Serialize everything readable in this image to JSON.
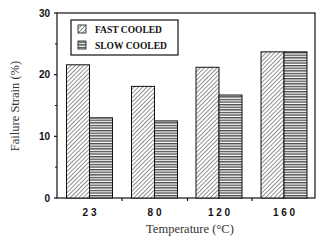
{
  "chart_data": {
    "type": "bar",
    "title": "",
    "xlabel": "Temperature (°C)",
    "ylabel": "Failure Strain (%)",
    "categories": [
      "2 3",
      "8 0",
      "1 2 0",
      "1 6 0"
    ],
    "series": [
      {
        "name": "FAST COOLED",
        "pattern": "diagonal-hatch",
        "values": [
          21.6,
          18.1,
          21.2,
          23.7
        ]
      },
      {
        "name": "SLOW COOLED",
        "pattern": "horizontal-lines",
        "values": [
          13.0,
          12.5,
          16.7,
          23.7
        ]
      }
    ],
    "ylim": [
      0,
      30
    ],
    "yticks": [
      "0",
      "10",
      "20",
      "30"
    ],
    "grid": false,
    "legend_position": "upper-left inside"
  },
  "legend": {
    "items": [
      {
        "label": "FAST COOLED"
      },
      {
        "label": "SLOW COOLED"
      }
    ]
  },
  "axes": {
    "x_title": "Temperature (°C)",
    "y_title": "Failure Strain (%)",
    "x_tick_labels": [
      "2 3",
      "8 0",
      "1 2 0",
      "1 6 0"
    ],
    "y_tick_labels": [
      "0",
      "10",
      "20",
      "30"
    ]
  }
}
